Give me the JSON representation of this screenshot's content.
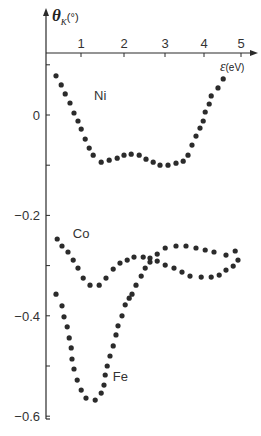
{
  "chart_data": {
    "type": "scatter",
    "title": "",
    "xlabel": "ε(eV)",
    "ylabel": "θK(°)",
    "ylabel_main": "θ",
    "ylabel_sub": "K",
    "ylabel_unit": "(°)",
    "xlabel_symbol": "ε",
    "xlabel_unit": "(eV)",
    "xlim": [
      0,
      5.3
    ],
    "ylim": [
      -0.6,
      0.15
    ],
    "xticks": [
      1,
      2,
      3,
      4,
      5
    ],
    "xtick_labels": [
      "1",
      "2",
      "3",
      "4",
      "5"
    ],
    "yticks": [
      0.1,
      0,
      -0.1,
      -0.2,
      -0.3,
      -0.4,
      -0.5,
      -0.6
    ],
    "ytick_labels": [
      {
        "value": 0,
        "label": "0"
      },
      {
        "value": -0.2,
        "label": "-0.2"
      },
      {
        "value": -0.4,
        "label": "-0.4"
      },
      {
        "value": -0.6,
        "label": "-0.6"
      }
    ],
    "grid": false,
    "legend": "inline labels",
    "series": [
      {
        "name": "Ni",
        "label_pos": {
          "x": 1.25,
          "y": 0.03
        },
        "points": [
          [
            0.3,
            0.078
          ],
          [
            0.43,
            0.06
          ],
          [
            0.53,
            0.042
          ],
          [
            0.65,
            0.024
          ],
          [
            0.75,
            0.004
          ],
          [
            0.85,
            -0.012
          ],
          [
            0.93,
            -0.028
          ],
          [
            1.03,
            -0.048
          ],
          [
            1.13,
            -0.066
          ],
          [
            1.23,
            -0.08
          ],
          [
            1.43,
            -0.094
          ],
          [
            1.63,
            -0.09
          ],
          [
            1.83,
            -0.086
          ],
          [
            2.0,
            -0.08
          ],
          [
            2.18,
            -0.078
          ],
          [
            2.38,
            -0.08
          ],
          [
            2.55,
            -0.088
          ],
          [
            2.73,
            -0.094
          ],
          [
            2.9,
            -0.1
          ],
          [
            3.1,
            -0.1
          ],
          [
            3.3,
            -0.096
          ],
          [
            3.48,
            -0.092
          ],
          [
            3.6,
            -0.08
          ],
          [
            3.7,
            -0.06
          ],
          [
            3.8,
            -0.042
          ],
          [
            3.9,
            -0.026
          ],
          [
            3.98,
            -0.012
          ],
          [
            4.03,
            0.006
          ],
          [
            4.13,
            0.022
          ],
          [
            4.18,
            0.038
          ],
          [
            4.35,
            0.054
          ],
          [
            4.48,
            0.072
          ]
        ]
      },
      {
        "name": "Co",
        "label_pos": {
          "x": 0.72,
          "y": -0.245
        },
        "points": [
          [
            0.33,
            -0.247
          ],
          [
            0.45,
            -0.261
          ],
          [
            0.6,
            -0.273
          ],
          [
            0.73,
            -0.289
          ],
          [
            0.85,
            -0.305
          ],
          [
            0.98,
            -0.325
          ],
          [
            1.15,
            -0.339
          ],
          [
            1.38,
            -0.339
          ],
          [
            1.55,
            -0.325
          ],
          [
            1.73,
            -0.307
          ],
          [
            1.9,
            -0.295
          ],
          [
            2.08,
            -0.289
          ],
          [
            2.25,
            -0.283
          ],
          [
            2.48,
            -0.283
          ],
          [
            2.65,
            -0.285
          ],
          [
            2.83,
            -0.291
          ],
          [
            3.03,
            -0.299
          ],
          [
            3.25,
            -0.305
          ],
          [
            3.45,
            -0.313
          ],
          [
            3.65,
            -0.321
          ],
          [
            3.93,
            -0.323
          ],
          [
            4.18,
            -0.323
          ],
          [
            4.38,
            -0.319
          ],
          [
            4.55,
            -0.309
          ],
          [
            4.73,
            -0.301
          ],
          [
            4.85,
            -0.289
          ]
        ]
      },
      {
        "name": "Fe",
        "label_pos": {
          "x": 1.72,
          "y": -0.53
        },
        "points": [
          [
            0.3,
            -0.357
          ],
          [
            0.45,
            -0.38
          ],
          [
            0.5,
            -0.402
          ],
          [
            0.58,
            -0.422
          ],
          [
            0.63,
            -0.444
          ],
          [
            0.68,
            -0.464
          ],
          [
            0.7,
            -0.486
          ],
          [
            0.75,
            -0.506
          ],
          [
            0.83,
            -0.528
          ],
          [
            0.93,
            -0.548
          ],
          [
            1.05,
            -0.564
          ],
          [
            1.28,
            -0.568
          ],
          [
            1.43,
            -0.554
          ],
          [
            1.5,
            -0.538
          ],
          [
            1.53,
            -0.518
          ],
          [
            1.58,
            -0.5
          ],
          [
            1.65,
            -0.48
          ],
          [
            1.73,
            -0.46
          ],
          [
            1.8,
            -0.438
          ],
          [
            1.85,
            -0.42
          ],
          [
            1.95,
            -0.4
          ],
          [
            2.03,
            -0.378
          ],
          [
            2.13,
            -0.365
          ],
          [
            2.2,
            -0.357
          ],
          [
            2.3,
            -0.339
          ],
          [
            2.43,
            -0.321
          ],
          [
            2.53,
            -0.305
          ],
          [
            2.65,
            -0.293
          ],
          [
            2.83,
            -0.277
          ],
          [
            3.03,
            -0.265
          ],
          [
            3.3,
            -0.261
          ],
          [
            3.55,
            -0.261
          ],
          [
            3.8,
            -0.265
          ],
          [
            4.03,
            -0.269
          ],
          [
            4.25,
            -0.273
          ],
          [
            4.55,
            -0.279
          ],
          [
            4.78,
            -0.271
          ]
        ]
      }
    ],
    "colors": {
      "dots": "#2b2b2b",
      "axes": "#2a2a2a",
      "text": "#333333"
    }
  }
}
